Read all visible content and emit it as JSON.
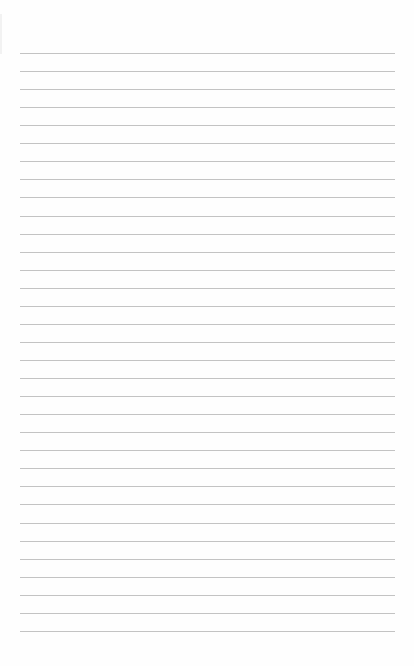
{
  "document": {
    "type": "lined-paper",
    "text": "",
    "rule_count": 33,
    "first_rule_y": 53,
    "rule_spacing": 18.06,
    "rule_left": 20,
    "rule_right": 395,
    "colors": {
      "paper": "#fefefe",
      "rule": "#b9b9b9"
    }
  }
}
